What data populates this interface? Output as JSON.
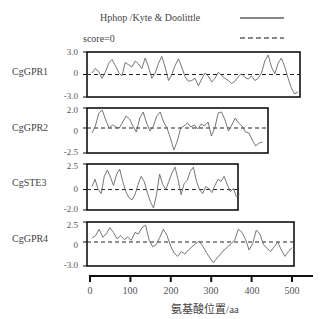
{
  "chart_data": {
    "type": "line",
    "title": "",
    "legend": [
      {
        "label": "Hphop /Kyte & Doolittle",
        "style": "solid"
      },
      {
        "label": "score=0",
        "style": "dashed"
      }
    ],
    "xlabel": "氨基酸位置/aa",
    "x_ticks": [
      0,
      100,
      200,
      300,
      400,
      500
    ],
    "xlim": [
      0,
      550
    ],
    "panels": [
      {
        "name": "CgGPR1",
        "length": 520,
        "ylim": [
          -3.0,
          3.0
        ],
        "yticks": [
          "3.0",
          "0",
          "-3.0"
        ],
        "values": [
          0.2,
          0.8,
          0.4,
          -0.5,
          0.3,
          1.5,
          2.0,
          1.2,
          0.3,
          -0.2,
          1.6,
          1.3,
          1.0,
          1.8,
          1.4,
          0.8,
          2.2,
          1.0,
          -0.5,
          0.2,
          1.5,
          2.4,
          1.0,
          -0.8,
          0.0,
          1.2,
          2.1,
          1.0,
          -0.3,
          -0.9,
          -0.8,
          -0.5,
          -1.5,
          -0.6,
          0.2,
          -0.2,
          -1.0,
          -0.5,
          0.3,
          -0.1,
          -0.5,
          -0.8,
          -1.2,
          -0.9,
          -0.3,
          0.1,
          -0.4,
          -0.6,
          -0.2,
          -0.8,
          -0.5,
          0.2,
          1.8,
          2.6,
          1.0,
          0.1,
          1.5,
          2.2,
          1.0,
          -0.5,
          -1.8,
          -2.6,
          -2.3
        ]
      },
      {
        "name": "CgGPR2",
        "length": 432,
        "ylim": [
          -2.5,
          2.0
        ],
        "yticks": [
          "2.0",
          "0",
          "-2.5"
        ],
        "values": [
          -0.5,
          0.2,
          1.5,
          1.8,
          0.8,
          0.0,
          0.3,
          0.1,
          0.0,
          0.6,
          1.2,
          0.9,
          0.2,
          -0.4,
          1.0,
          1.6,
          0.5,
          -0.3,
          0.2,
          1.2,
          1.6,
          0.6,
          0.0,
          -1.0,
          -2.2,
          -1.3,
          0.0,
          0.2,
          0.5,
          0.1,
          0.3,
          -0.1,
          0.4,
          0.2,
          0.6,
          -0.8,
          0.0,
          1.5,
          1.6,
          0.8,
          -0.3,
          0.3,
          1.0,
          0.5,
          0.2,
          -0.4,
          -0.5,
          -1.2,
          -1.8,
          -1.5,
          -1.4
        ]
      },
      {
        "name": "CgSTE3",
        "length": 375,
        "ylim": [
          -2.0,
          2.5
        ],
        "yticks": [
          "2.5",
          "0",
          "-2.0"
        ],
        "values": [
          0.3,
          1.0,
          0.0,
          -0.4,
          1.3,
          1.9,
          1.2,
          0.4,
          1.5,
          2.0,
          0.8,
          -0.2,
          -0.8,
          -1.0,
          -0.5,
          0.5,
          1.3,
          0.8,
          -0.3,
          -1.2,
          -1.8,
          -0.5,
          1.5,
          0.5,
          0.0,
          0.8,
          1.6,
          2.2,
          1.0,
          -0.5,
          0.6,
          0.9,
          1.8,
          2.2,
          0.8,
          0.0,
          -0.4,
          0.3,
          0.1,
          -0.3,
          0.4,
          1.0,
          0.8,
          1.3,
          0.5,
          -0.2,
          0.1,
          -0.7,
          -0.5
        ]
      },
      {
        "name": "CgGPR4",
        "length": 505,
        "ylim": [
          -3.0,
          2.5
        ],
        "yticks": [
          "2.5",
          "0",
          "-3.0"
        ],
        "values": [
          0.5,
          0.8,
          1.6,
          0.6,
          1.0,
          1.8,
          1.2,
          0.4,
          0.8,
          0.3,
          0.6,
          0.2,
          1.2,
          1.0,
          1.8,
          2.1,
          0.2,
          -0.6,
          -0.3,
          0.6,
          1.6,
          0.8,
          -0.5,
          -1.4,
          -1.8,
          -1.2,
          -1.5,
          -1.0,
          -0.6,
          -0.2,
          0.1,
          -0.5,
          -1.3,
          -2.0,
          -2.6,
          -2.0,
          -1.5,
          -1.0,
          -0.6,
          -0.2,
          0.3,
          1.6,
          1.2,
          0.3,
          -1.0,
          -0.2,
          1.5,
          1.0,
          -0.3,
          -0.8,
          -1.2,
          -0.6,
          0.0,
          -1.0,
          -1.8,
          -1.2,
          -0.7
        ]
      }
    ]
  },
  "legend": {
    "item1": "Hphop /Kyte & Doolittle",
    "item2": "score=0"
  },
  "panels": [
    {
      "label": "CgGPR1",
      "ymax": "3.0",
      "yzero": "0",
      "ymin": "-3.0"
    },
    {
      "label": "CgGPR2",
      "ymax": "2.0",
      "yzero": "0",
      "ymin": "-2.5"
    },
    {
      "label": "CgSTE3",
      "ymax": "2.5",
      "yzero": "0",
      "ymin": "-2.0"
    },
    {
      "label": "CgGPR4",
      "ymax": "2.5",
      "yzero": "0",
      "ymin": "-3.0"
    }
  ],
  "xaxis": {
    "ticks": [
      "0",
      "100",
      "200",
      "300",
      "400",
      "500"
    ],
    "label": "氨基酸位置/aa"
  }
}
